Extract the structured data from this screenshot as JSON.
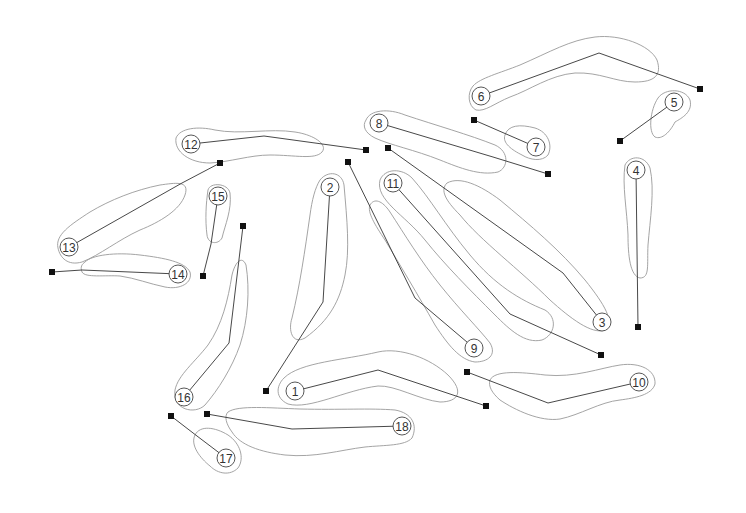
{
  "diagram": {
    "type": "golf course layout",
    "background": "#ffffff",
    "holes": [
      {
        "label": "1",
        "green": [
          295,
          391
        ],
        "tee": [
          486,
          406
        ],
        "bend": [
          378,
          370
        ]
      },
      {
        "label": "2",
        "green": [
          330,
          187
        ],
        "tee": [
          266,
          391
        ],
        "bend": [
          323,
          302
        ]
      },
      {
        "label": "3",
        "green": [
          602,
          322
        ],
        "tee": [
          388,
          148
        ],
        "bend": [
          563,
          273
        ]
      },
      {
        "label": "4",
        "green": [
          636,
          170
        ],
        "tee": [
          638,
          327
        ],
        "bend": null
      },
      {
        "label": "5",
        "green": [
          674,
          102
        ],
        "tee": [
          620,
          141
        ],
        "bend": null
      },
      {
        "label": "6",
        "green": [
          481,
          96
        ],
        "tee": [
          700,
          89
        ],
        "bend": [
          599,
          53
        ]
      },
      {
        "label": "7",
        "green": [
          536,
          147
        ],
        "tee": [
          474,
          120
        ],
        "bend": null
      },
      {
        "label": "8",
        "green": [
          379,
          123
        ],
        "tee": [
          548,
          174
        ],
        "bend": [
          493,
          157
        ]
      },
      {
        "label": "9",
        "green": [
          474,
          348
        ],
        "tee": [
          348,
          162
        ],
        "bend": [
          415,
          298
        ]
      },
      {
        "label": "10",
        "green": [
          639,
          382
        ],
        "tee": [
          467,
          372
        ],
        "bend": [
          548,
          403
        ]
      },
      {
        "label": "11",
        "green": [
          393,
          183
        ],
        "tee": [
          601,
          355
        ],
        "bend": [
          510,
          314
        ]
      },
      {
        "label": "12",
        "green": [
          191,
          144
        ],
        "tee": [
          366,
          150
        ],
        "bend": [
          264,
          136
        ]
      },
      {
        "label": "13",
        "green": [
          69,
          247
        ],
        "tee": [
          220,
          163
        ],
        "bend": [
          182,
          183
        ]
      },
      {
        "label": "14",
        "green": [
          178,
          274
        ],
        "tee": [
          52,
          272
        ],
        "bend": [
          82,
          270
        ]
      },
      {
        "label": "15",
        "green": [
          218,
          196
        ],
        "tee": [
          203,
          276
        ],
        "bend": [
          211,
          244
        ]
      },
      {
        "label": "16",
        "green": [
          184,
          397
        ],
        "tee": [
          243,
          226
        ],
        "bend": [
          229,
          343
        ]
      },
      {
        "label": "17",
        "green": [
          226,
          458
        ],
        "tee": [
          171,
          416
        ],
        "bend": [
          197,
          436
        ]
      },
      {
        "label": "18",
        "green": [
          402,
          426
        ],
        "tee": [
          207,
          414
        ],
        "bend": [
          292,
          429
        ]
      }
    ]
  }
}
